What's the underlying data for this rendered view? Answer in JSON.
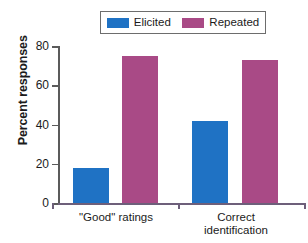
{
  "chart_data": {
    "type": "bar",
    "title": "",
    "xlabel": "",
    "ylabel": "Percent responses",
    "ylim": [
      0,
      80
    ],
    "yticks": [
      0,
      20,
      40,
      60,
      80
    ],
    "grid": false,
    "legend_position": "top-center",
    "categories": [
      "\"Good\" ratings",
      "Correct\nidentification"
    ],
    "series": [
      {
        "name": "Elicited",
        "color": "#1f72c4",
        "values": [
          18,
          42
        ]
      },
      {
        "name": "Repeated",
        "color": "#a94a86",
        "values": [
          75,
          73
        ]
      }
    ]
  },
  "legend": {
    "items": [
      {
        "label": "Elicited",
        "color": "#1f72c4"
      },
      {
        "label": "Repeated",
        "color": "#a94a86"
      }
    ]
  },
  "axis": {
    "y_title": "Percent responses",
    "y_tick_labels": [
      "80",
      "60",
      "40",
      "20",
      "0"
    ],
    "x_tick_labels": [
      "\"Good\" ratings",
      "Correct\nidentification"
    ]
  },
  "colors": {
    "elicited": "#1f72c4",
    "repeated": "#a94a86",
    "axis": "#5b5b5b",
    "x_axis": "#6d5f7a",
    "legend_border": "#6d6d6d",
    "text": "#1b1b1b",
    "background": "#ffffff"
  }
}
